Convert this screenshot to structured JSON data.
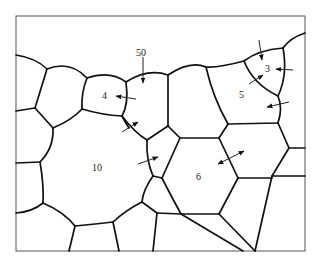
{
  "figure": {
    "type": "grain-boundary-migration-diagram",
    "colors": {
      "line": "#111111",
      "background": "#ffffff",
      "frame": "#555555"
    },
    "grain_labels": [
      {
        "id": "g50",
        "text": "50"
      },
      {
        "id": "g4",
        "text": "4"
      },
      {
        "id": "g3",
        "text": "3"
      },
      {
        "id": "g5",
        "text": "5"
      },
      {
        "id": "g10",
        "text": "10"
      },
      {
        "id": "g6",
        "text": "6"
      }
    ],
    "arrows": [
      {
        "near": "50",
        "direction": "down"
      },
      {
        "near": "4",
        "direction": "toward-4"
      },
      {
        "near": "3",
        "direction": "toward-3 (top)"
      },
      {
        "near": "3",
        "direction": "toward-3 (right)"
      },
      {
        "near": "3/5",
        "direction": "toward-3 (lower-left)"
      },
      {
        "near": "5",
        "direction": "toward-5"
      },
      {
        "near": "4/10",
        "direction": "toward-small-grain"
      },
      {
        "near": "10",
        "direction": "toward-small-grain"
      },
      {
        "near": "6",
        "direction": "double-headed (flat boundary)"
      }
    ]
  }
}
